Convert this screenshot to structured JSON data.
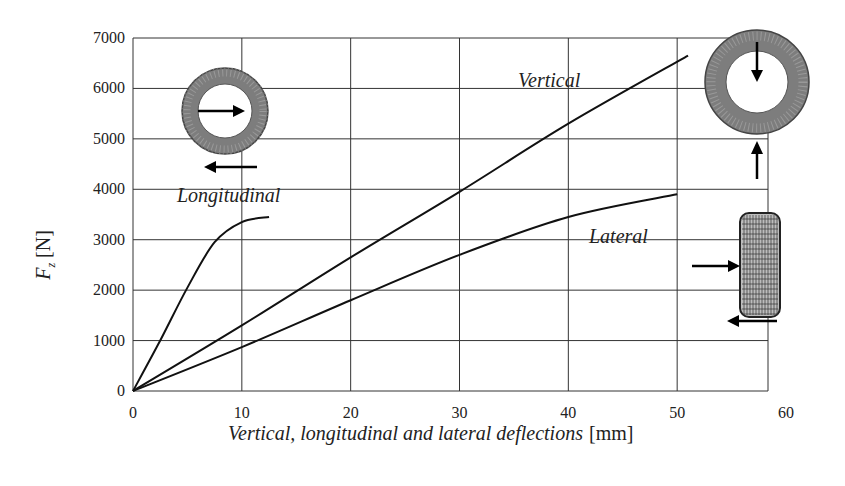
{
  "chart_data": {
    "type": "line",
    "title": "",
    "xlabel": "Vertical, longitudinal and lateral deflections [mm]",
    "xlabel_italic_part": "Vertical, longitudinal and lateral deflections",
    "xlabel_unit": "[mm]",
    "ylabel": "Fz [N]",
    "ylabel_symbol": "F",
    "ylabel_subscript": "z",
    "ylabel_unit": "[N]",
    "xlim": [
      0,
      60
    ],
    "ylim": [
      0,
      7000
    ],
    "x_ticks": [
      "0",
      "10",
      "20",
      "30",
      "40",
      "50",
      "60"
    ],
    "y_ticks": [
      "0",
      "1000",
      "2000",
      "3000",
      "4000",
      "5000",
      "6000",
      "7000"
    ],
    "grid": true,
    "series": [
      {
        "name": "Vertical",
        "x": [
          0,
          10,
          20,
          30,
          40,
          51
        ],
        "y": [
          0,
          1300,
          2650,
          3950,
          5300,
          6650
        ]
      },
      {
        "name": "Longitudinal",
        "x": [
          0,
          2.5,
          5,
          7.5,
          10,
          12.5
        ],
        "y": [
          0,
          1000,
          2050,
          2950,
          3350,
          3450
        ]
      },
      {
        "name": "Lateral",
        "x": [
          0,
          10,
          20,
          30,
          40,
          50
        ],
        "y": [
          0,
          870,
          1800,
          2700,
          3450,
          3900
        ]
      }
    ],
    "annotations": [
      "Vertical",
      "Longitudinal",
      "Lateral"
    ],
    "insets": [
      "tire-side-view-longitudinal-load",
      "tire-side-view-vertical-load",
      "tire-front-view-lateral-load"
    ]
  }
}
